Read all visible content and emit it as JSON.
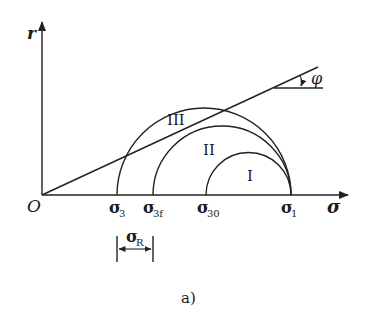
{
  "diagram": {
    "type": "mohr-circles",
    "caption": "a)",
    "axes": {
      "y_label": "r",
      "x_label": "σ",
      "origin_label": "O"
    },
    "x_ticks": [
      {
        "symbol": "σ",
        "sub": "3"
      },
      {
        "symbol": "σ",
        "sub": "3f"
      },
      {
        "symbol": "σ",
        "sub": "30"
      },
      {
        "symbol": "σ",
        "sub": "1"
      }
    ],
    "circles": [
      {
        "label": "III",
        "from": "σ3",
        "to": "σ1"
      },
      {
        "label": "II",
        "from": "σ3f",
        "to": "σ1"
      },
      {
        "label": "I",
        "from": "σ30",
        "to": "σ1"
      }
    ],
    "envelope": {
      "angle_label": "φ"
    },
    "dimension": {
      "symbol": "σ",
      "sub": "R",
      "from": "σ3",
      "to": "σ3f"
    },
    "colors": {
      "line": "#222222",
      "background": "#ffffff"
    }
  }
}
